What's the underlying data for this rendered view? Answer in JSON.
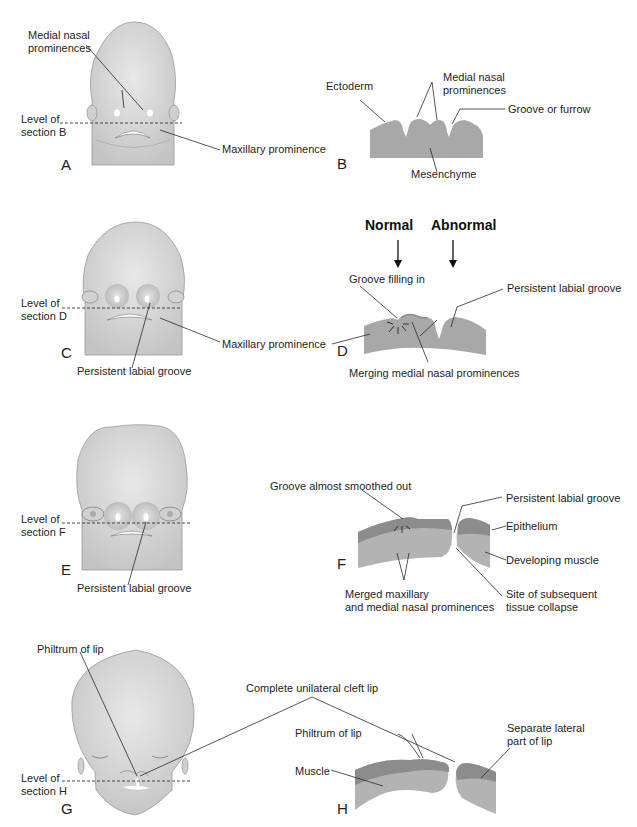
{
  "figure": {
    "colors": {
      "head_fill": "#dcdcdc",
      "head_shadow": "#c2c2c2",
      "section_fill": "#a8a8a8",
      "epithelium_fill": "#8c8c8c",
      "muscle_fill": "#b4b4b4",
      "line": "#2a2a2a"
    },
    "rows": [
      {
        "id": "row1",
        "left_panel": {
          "letter": "A",
          "labels": {
            "medial_nasal": "Medial nasal\nprominences",
            "level": "Level of\nsection B",
            "maxillary": "Maxillary prominence"
          }
        },
        "right_panel": {
          "letter": "B",
          "labels": {
            "ectoderm": "Ectoderm",
            "medial_nasal": "Medial nasal\nprominences",
            "groove": "Groove or furrow",
            "mesenchyme": "Mesenchyme"
          }
        }
      },
      {
        "id": "row2",
        "left_panel": {
          "letter": "C",
          "labels": {
            "level": "Level of\nsection D",
            "maxillary": "Maxillary prominence",
            "persistent": "Persistent labial groove"
          }
        },
        "right_panel": {
          "letter": "D",
          "headers": {
            "normal": "Normal",
            "abnormal": "Abnormal"
          },
          "labels": {
            "groove_filling": "Groove filling in",
            "persistent": "Persistent labial groove",
            "merging": "Merging medial nasal prominences"
          }
        }
      },
      {
        "id": "row3",
        "left_panel": {
          "letter": "E",
          "labels": {
            "level": "Level of\nsection F",
            "persistent": "Persistent labial groove"
          }
        },
        "right_panel": {
          "letter": "F",
          "labels": {
            "groove_smoothed": "Groove almost smoothed out",
            "persistent": "Persistent labial groove",
            "epithelium": "Epithelium",
            "muscle": "Developing muscle",
            "merged": "Merged maxillary\nand medial nasal prominences",
            "collapse": "Site of subsequent\ntissue collapse"
          }
        }
      },
      {
        "id": "row4",
        "left_panel": {
          "letter": "G",
          "labels": {
            "philtrum": "Philtrum of lip",
            "level": "Level of\nsection H"
          }
        },
        "right_panel": {
          "letter": "H",
          "labels": {
            "cleft": "Complete unilateral cleft lip",
            "philtrum": "Philtrum of lip",
            "muscle": "Muscle",
            "lateral": "Separate lateral\npart of lip"
          }
        }
      }
    ]
  }
}
